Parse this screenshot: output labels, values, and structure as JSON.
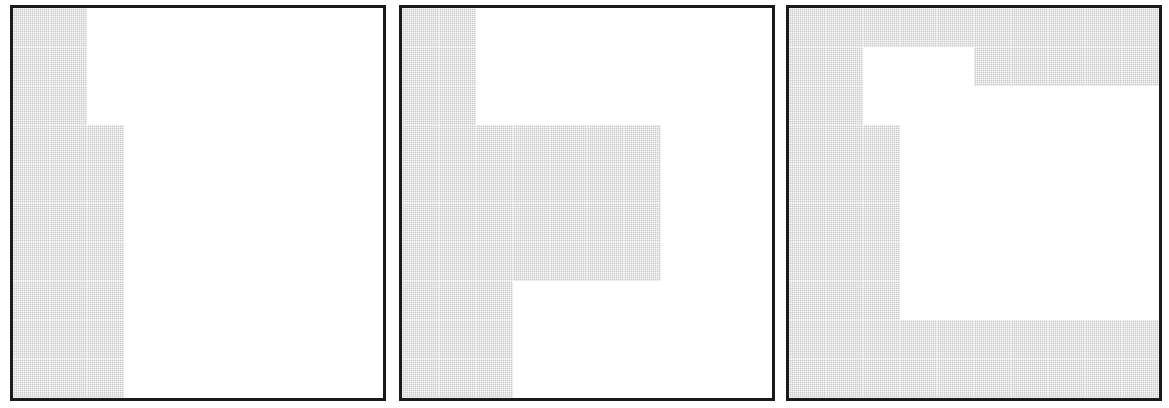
{
  "figure": {
    "title": "",
    "caption": "",
    "background_color": "#ffffff",
    "panel_count": 3,
    "panel_border_color": "#1a1a1a",
    "gridline_color": "#4d4d4d",
    "gridline_style": "dotted",
    "shaded_cell_color": "#c9c9c9",
    "empty_cell_color": "#ffffff"
  },
  "chart_data": {
    "type": "heatmap",
    "title": "",
    "xlabel": "",
    "ylabel": "",
    "grid": true,
    "legend": "none",
    "rows": 10,
    "cols": 10,
    "value_legend": {
      "0": "unshaded",
      "1": "shaded"
    },
    "panels": [
      {
        "id": "panel-1",
        "label": "",
        "rows": 10,
        "cols": 10,
        "matrix": [
          [
            1,
            1,
            0,
            0,
            0,
            0,
            0,
            0,
            0,
            0
          ],
          [
            1,
            1,
            0,
            0,
            0,
            0,
            0,
            0,
            0,
            0
          ],
          [
            1,
            1,
            0,
            0,
            0,
            0,
            0,
            0,
            0,
            0
          ],
          [
            1,
            1,
            1,
            0,
            0,
            0,
            0,
            0,
            0,
            0
          ],
          [
            1,
            1,
            1,
            0,
            0,
            0,
            0,
            0,
            0,
            0
          ],
          [
            1,
            1,
            1,
            0,
            0,
            0,
            0,
            0,
            0,
            0
          ],
          [
            1,
            1,
            1,
            0,
            0,
            0,
            0,
            0,
            0,
            0
          ],
          [
            1,
            1,
            1,
            0,
            0,
            0,
            0,
            0,
            0,
            0
          ],
          [
            1,
            1,
            1,
            0,
            0,
            0,
            0,
            0,
            0,
            0
          ],
          [
            1,
            1,
            1,
            0,
            0,
            0,
            0,
            0,
            0,
            0
          ]
        ],
        "shaded_count": 28
      },
      {
        "id": "panel-2",
        "label": "",
        "rows": 10,
        "cols": 10,
        "matrix": [
          [
            1,
            1,
            0,
            0,
            0,
            0,
            0,
            0,
            0,
            0
          ],
          [
            1,
            1,
            0,
            0,
            0,
            0,
            0,
            0,
            0,
            0
          ],
          [
            1,
            1,
            0,
            0,
            0,
            0,
            0,
            0,
            0,
            0
          ],
          [
            1,
            1,
            1,
            1,
            1,
            1,
            1,
            0,
            0,
            0
          ],
          [
            1,
            1,
            1,
            1,
            1,
            1,
            1,
            0,
            0,
            0
          ],
          [
            1,
            1,
            1,
            1,
            1,
            1,
            1,
            0,
            0,
            0
          ],
          [
            1,
            1,
            1,
            1,
            1,
            1,
            1,
            0,
            0,
            0
          ],
          [
            1,
            1,
            1,
            0,
            0,
            0,
            0,
            0,
            0,
            0
          ],
          [
            1,
            1,
            1,
            0,
            0,
            0,
            0,
            0,
            0,
            0
          ],
          [
            1,
            1,
            1,
            0,
            0,
            0,
            0,
            0,
            0,
            0
          ]
        ],
        "shaded_count": 43
      },
      {
        "id": "panel-3",
        "label": "",
        "rows": 10,
        "cols": 10,
        "matrix": [
          [
            1,
            1,
            1,
            1,
            1,
            1,
            1,
            1,
            1,
            1
          ],
          [
            1,
            1,
            0,
            0,
            0,
            1,
            1,
            1,
            1,
            1
          ],
          [
            1,
            1,
            0,
            0,
            0,
            0,
            0,
            0,
            0,
            0
          ],
          [
            1,
            1,
            1,
            0,
            0,
            0,
            0,
            0,
            0,
            0
          ],
          [
            1,
            1,
            1,
            0,
            0,
            0,
            0,
            0,
            0,
            0
          ],
          [
            1,
            1,
            1,
            0,
            0,
            0,
            0,
            0,
            0,
            0
          ],
          [
            1,
            1,
            1,
            0,
            0,
            0,
            0,
            0,
            0,
            0
          ],
          [
            1,
            1,
            1,
            0,
            0,
            0,
            0,
            0,
            0,
            0
          ],
          [
            1,
            1,
            1,
            1,
            1,
            1,
            1,
            1,
            1,
            1
          ],
          [
            1,
            1,
            1,
            1,
            1,
            1,
            1,
            1,
            1,
            1
          ]
        ],
        "shaded_count": 60
      }
    ]
  },
  "layout": {
    "panel_geometry": [
      {
        "left": 10,
        "top": 5,
        "width": 376,
        "height": 396
      },
      {
        "left": 399,
        "top": 5,
        "width": 376,
        "height": 396
      },
      {
        "left": 786,
        "top": 5,
        "width": 376,
        "height": 396
      }
    ]
  }
}
